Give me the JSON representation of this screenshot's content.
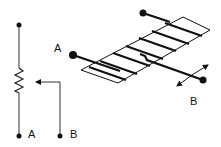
{
  "diagram": {
    "schematic": {
      "terminal_a_label": "A",
      "terminal_b_label": "B"
    },
    "physical": {
      "terminal_a_label": "A",
      "terminal_b_label": "B"
    },
    "colors": {
      "stroke": "#111111",
      "background": "#ffffff"
    }
  }
}
